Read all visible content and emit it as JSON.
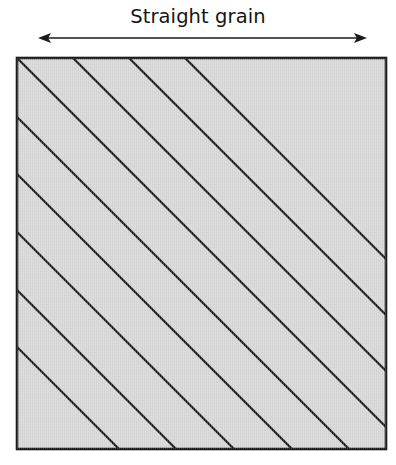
{
  "figure": {
    "title": "Straight grain",
    "background_color": "#ffffff",
    "ink_color": "#1a1a1a",
    "fabric_fill_color": "#d6d6d6",
    "fabric_border_color": "#1c1c1c"
  },
  "title_label": {
    "text": "Straight grain",
    "color": "#141414",
    "font_size_px": 19.5
  },
  "grain_arrow": {
    "name": "double-headed-arrow",
    "orientation": "horizontal",
    "x_start": 38,
    "x_end": 367,
    "y": 38,
    "shaft_width_px": 1.6,
    "arrowhead_length_px": 13,
    "arrowhead_half_width_px": 5,
    "color": "#1a1a1a",
    "heads": [
      "left",
      "right"
    ]
  },
  "fabric_square": {
    "name": "fabric-swatch",
    "x": 17,
    "y": 58,
    "width": 369,
    "height": 391,
    "fill": "#d6d6d6",
    "stroke": "#1c1c1c",
    "stroke_width_px": 2.6
  },
  "bias_lines": {
    "name": "bias-grain-lines",
    "angle_degrees": 45,
    "direction": "down-right",
    "stroke": "#141414",
    "stroke_width_px": 2.2,
    "pitch_px": 56.5,
    "count": 9,
    "note": "45-degree bias lines drawn across the fabric square",
    "segments": [
      {
        "x1": 17,
        "y1": 58,
        "x2": 386,
        "y2": 427
      },
      {
        "x1": 73,
        "y1": 58,
        "x2": 386,
        "y2": 371
      },
      {
        "x1": 129,
        "y1": 58,
        "x2": 386,
        "y2": 315
      },
      {
        "x1": 17,
        "y1": 117,
        "x2": 349,
        "y2": 449
      },
      {
        "x1": 17,
        "y1": 174,
        "x2": 292,
        "y2": 449
      },
      {
        "x1": 17,
        "y1": 232,
        "x2": 234,
        "y2": 449
      },
      {
        "x1": 17,
        "y1": 290,
        "x2": 176,
        "y2": 449
      },
      {
        "x1": 185,
        "y1": 58,
        "x2": 386,
        "y2": 259
      },
      {
        "x1": 17,
        "y1": 347,
        "x2": 119,
        "y2": 449
      }
    ]
  },
  "chart_data": {
    "type": "diagram",
    "title": "Straight grain",
    "annotations": [
      {
        "label": "Straight grain",
        "kind": "axis-arrow",
        "direction": "horizontal"
      }
    ]
  }
}
